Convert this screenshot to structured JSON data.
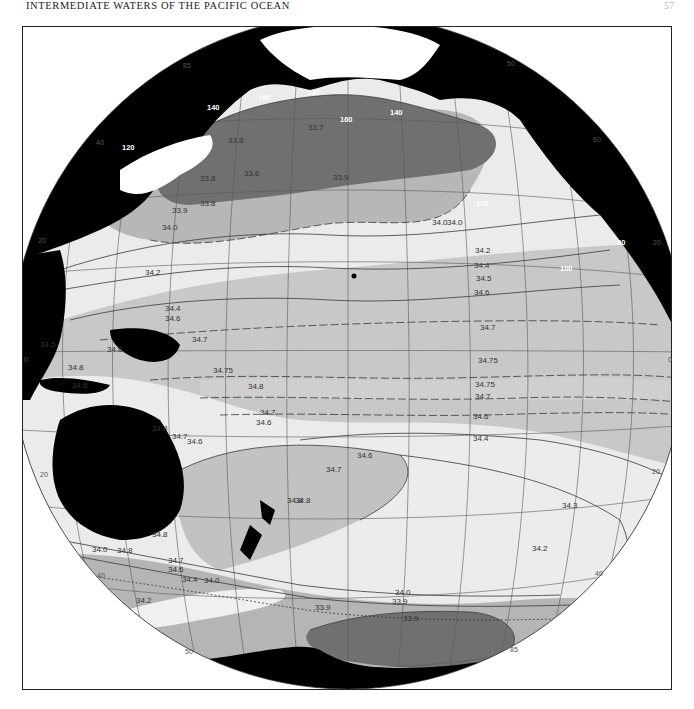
{
  "page": {
    "header": "INTERMEDIATE WATERS OF THE PACIFIC OCEAN",
    "page_number": "57"
  },
  "map": {
    "title": "Salinity of Pacific Intermediate Waters",
    "projection": "orthographic disk centered on Pacific",
    "colors": {
      "land": "#000000",
      "ice_unmapped": "#ffffff",
      "salinity_lt_33_9": "#6e6e6e",
      "salinity_33_9_34_0": "#b4b4b4",
      "salinity_34_0_34_6": "#e8e8e8",
      "salinity_34_6_34_8": "#c6c6c6",
      "grid": "#555555",
      "contour": "#3a3a3a"
    },
    "meridian_labels": {
      "north_top": [
        "140",
        "160",
        "180",
        "160",
        "140",
        "120"
      ],
      "northwest_rim": [
        "120",
        "40",
        "20",
        "85"
      ],
      "northeast_rim": [
        "50",
        "60",
        "100",
        "80",
        "20"
      ],
      "equator_left": "0",
      "equator_right": "0",
      "southwest_rim": [
        "20",
        "40",
        "50"
      ],
      "southeast_rim": [
        "20",
        "40",
        "85"
      ]
    },
    "contour_labels": {
      "north": [
        "33.7",
        "33.8",
        "33.6",
        "33.8",
        "33.9",
        "33.8",
        "33.9",
        "34.0",
        "34.0",
        "34.0"
      ],
      "north_east": [
        "34.2",
        "34.4",
        "34.5",
        "34.6"
      ],
      "central": [
        "34.2",
        "34.4",
        "34.6",
        "34.7",
        "34.7",
        "34.75",
        "34.75",
        "34.75",
        "34.7"
      ],
      "west": [
        "34.5",
        "34.6",
        "34.8",
        "34.6",
        "34.8",
        "34.7",
        "34.6",
        "34.8",
        "34.7",
        "34.6",
        "34.8"
      ],
      "south_central": [
        "34.6",
        "34.4",
        "34.6",
        "34.7",
        "34.8",
        "34.3",
        "34.2"
      ],
      "southern": [
        "34.0",
        "34.8",
        "34.8",
        "34.7",
        "34.6",
        "34.4",
        "34.0",
        "34.2",
        "33.9",
        "34.0",
        "33.9",
        "33.9"
      ]
    }
  }
}
